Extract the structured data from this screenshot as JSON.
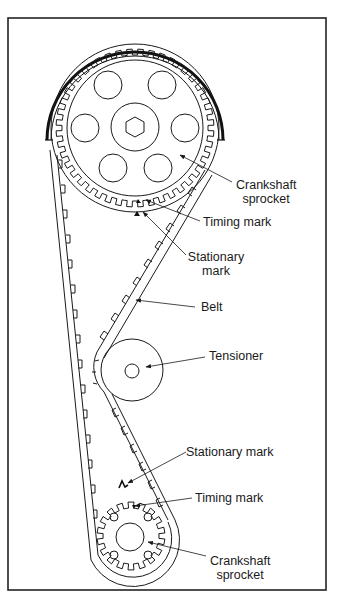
{
  "figure": {
    "frame_color": "#222222",
    "line_color": "#1a1a1a",
    "background": "#ffffff"
  },
  "labels": {
    "top_sprocket_line1": "Crankshaft",
    "top_sprocket_line2": "sprocket",
    "top_timing_mark": "Timing mark",
    "top_stationary_line1": "Stationary",
    "top_stationary_line2": "mark",
    "belt": "Belt",
    "tensioner": "Tensioner",
    "bottom_stationary_mark": "Stationary mark",
    "bottom_timing_mark": "Timing mark",
    "bottom_sprocket_line1": "Crankshaft",
    "bottom_sprocket_line2": "sprocket"
  },
  "components": [
    {
      "name": "top-sprocket",
      "teeth": 44,
      "bolt_holes": 6,
      "hub": "hex"
    },
    {
      "name": "timing-cover-arc"
    },
    {
      "name": "tensioner-pulley"
    },
    {
      "name": "bottom-sprocket",
      "teeth": 18,
      "bolt_holes": 4
    },
    {
      "name": "timing-belt"
    }
  ]
}
